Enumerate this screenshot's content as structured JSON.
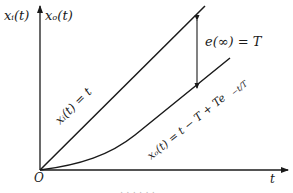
{
  "diagram": {
    "axes": {
      "y_label_input": "xᵢ(t)",
      "y_label_output": "xₒ(t)",
      "x_label": "t",
      "origin_label": "O"
    },
    "curves": {
      "input": {
        "label": "xᵢ(t) = t"
      },
      "output": {
        "label": "xₒ(t) = t − T + Te",
        "exponent": "−t/T"
      }
    },
    "error": {
      "label": "e(∞) = T"
    },
    "caption": "· · · · · ·"
  },
  "colors": {
    "line": "#1a1a1a",
    "background": "#ffffff",
    "caption": "#bdbdbd"
  }
}
